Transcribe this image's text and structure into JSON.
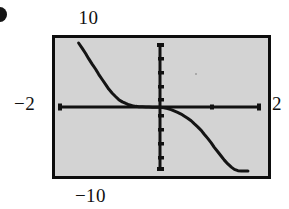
{
  "figure": {
    "marker": "bullet-partial",
    "screen": {
      "background_color": "#d3d3d3",
      "border_color": "#0d0d0d"
    }
  },
  "labels": {
    "top": "10",
    "bottom": "−10",
    "left": "−2",
    "right": "2"
  },
  "chart_data": {
    "type": "line",
    "title": "",
    "subtitle": "",
    "xlabel": "",
    "ylabel": "",
    "xlim": [
      -2,
      2
    ],
    "ylim": [
      -10,
      10
    ],
    "grid": false,
    "legend": null,
    "axes": {
      "x_axis_label_left": "−2",
      "x_axis_label_right": "2",
      "y_axis_label_top": "10",
      "y_axis_label_bottom": "−10",
      "x_tick_interval": 1,
      "y_tick_interval": 2,
      "x_ticks": [
        -1,
        1
      ],
      "y_ticks": [
        -8,
        -6,
        -4,
        -2,
        2,
        4,
        6,
        8
      ]
    },
    "annotations": [],
    "series": [
      {
        "name": "curve",
        "description": "odd, strictly decreasing function with a flat plateau near the origin",
        "x": [
          -1.62,
          -1.55,
          -1.48,
          -1.42,
          -1.35,
          -1.28,
          -1.22,
          -1.15,
          -1.08,
          -1.02,
          -0.95,
          -0.88,
          -0.82,
          -0.75,
          -0.68,
          -0.62,
          -0.55,
          -0.48,
          -0.42,
          -0.35,
          -0.28,
          -0.22,
          -0.15,
          -0.08,
          0.0,
          0.08,
          0.15,
          0.22,
          0.28,
          0.35,
          0.42,
          0.48,
          0.55,
          0.62,
          0.68,
          0.75,
          0.82,
          0.88,
          0.95,
          1.02,
          1.08,
          1.15,
          1.22,
          1.28,
          1.35,
          1.42,
          1.48,
          1.55,
          1.62,
          1.68,
          1.75
        ],
        "y": [
          10.0,
          9.2,
          8.35,
          7.55,
          6.7,
          5.9,
          5.1,
          4.3,
          3.5,
          2.8,
          2.15,
          1.6,
          1.15,
          0.8,
          0.55,
          0.35,
          0.2,
          0.1,
          0.05,
          0.02,
          0.0,
          -0.01,
          -0.02,
          -0.03,
          -0.05,
          -0.12,
          -0.25,
          -0.42,
          -0.62,
          -0.85,
          -1.1,
          -1.4,
          -1.75,
          -2.15,
          -2.6,
          -3.1,
          -3.65,
          -4.25,
          -4.9,
          -5.6,
          -6.3,
          -7.0,
          -7.7,
          -8.3,
          -8.9,
          -9.4,
          -9.75,
          -9.95,
          -10.0,
          -10.0,
          -10.0
        ]
      }
    ]
  }
}
